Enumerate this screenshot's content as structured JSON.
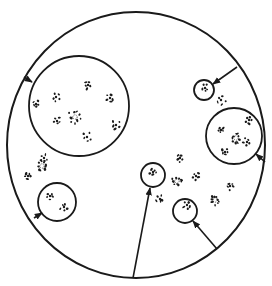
{
  "diagram": {
    "ink": "#1a1a1a",
    "background": "#ffffff",
    "outer_boundary": {
      "cx": 136,
      "cy": 145,
      "rx": 129,
      "ry": 133,
      "stroke": 2
    },
    "circles": [
      {
        "id": "large-top-left",
        "cx": 79,
        "cy": 106,
        "r": 50
      },
      {
        "id": "small-top-right",
        "cx": 204,
        "cy": 90,
        "r": 10
      },
      {
        "id": "right",
        "cx": 234,
        "cy": 136,
        "r": 28
      },
      {
        "id": "bottom-left",
        "cx": 57,
        "cy": 202,
        "r": 19
      },
      {
        "id": "bottom-center-left",
        "cx": 153,
        "cy": 175,
        "r": 12
      },
      {
        "id": "bottom-center-right",
        "cx": 185,
        "cy": 211,
        "r": 12
      }
    ],
    "arrows": [
      {
        "target": "large-top-left",
        "x1": 24,
        "y1": 77,
        "x2": 32,
        "y2": 82
      },
      {
        "target": "small-top-right",
        "x1": 237,
        "y1": 67,
        "x2": 213,
        "y2": 84
      },
      {
        "target": "right",
        "x1": 265,
        "y1": 162,
        "x2": 256,
        "y2": 154
      },
      {
        "target": "bottom-left",
        "x1": 34,
        "y1": 218,
        "x2": 42,
        "y2": 213
      },
      {
        "target": "bottom-center-left",
        "x1": 133,
        "y1": 278,
        "x2": 150,
        "y2": 188
      },
      {
        "target": "bottom-center-right",
        "x1": 217,
        "y1": 249,
        "x2": 193,
        "y2": 221
      }
    ],
    "clusters": [
      {
        "cx": 75,
        "cy": 117,
        "r": 7,
        "ring": true
      },
      {
        "cx": 56,
        "cy": 97,
        "r": 5
      },
      {
        "cx": 88,
        "cy": 85,
        "r": 4
      },
      {
        "cx": 110,
        "cy": 98,
        "r": 4
      },
      {
        "cx": 36,
        "cy": 104,
        "r": 4
      },
      {
        "cx": 57,
        "cy": 121,
        "r": 4
      },
      {
        "cx": 116,
        "cy": 125,
        "r": 5
      },
      {
        "cx": 87,
        "cy": 137,
        "r": 5
      },
      {
        "cx": 44,
        "cy": 158,
        "r": 4
      },
      {
        "cx": 42,
        "cy": 166,
        "r": 5,
        "ring": true
      },
      {
        "cx": 28,
        "cy": 176,
        "r": 4
      },
      {
        "cx": 50,
        "cy": 196,
        "r": 4
      },
      {
        "cx": 64,
        "cy": 207,
        "r": 4
      },
      {
        "cx": 205,
        "cy": 88,
        "r": 4
      },
      {
        "cx": 221,
        "cy": 100,
        "r": 5
      },
      {
        "cx": 236,
        "cy": 138,
        "r": 5,
        "ring": true
      },
      {
        "cx": 221,
        "cy": 130,
        "r": 4
      },
      {
        "cx": 249,
        "cy": 120,
        "r": 4
      },
      {
        "cx": 247,
        "cy": 142,
        "r": 4
      },
      {
        "cx": 225,
        "cy": 152,
        "r": 4
      },
      {
        "cx": 153,
        "cy": 172,
        "r": 4
      },
      {
        "cx": 180,
        "cy": 158,
        "r": 4
      },
      {
        "cx": 177,
        "cy": 181,
        "r": 5,
        "ring": true
      },
      {
        "cx": 196,
        "cy": 176,
        "r": 4
      },
      {
        "cx": 187,
        "cy": 205,
        "r": 4
      },
      {
        "cx": 160,
        "cy": 199,
        "r": 4
      },
      {
        "cx": 215,
        "cy": 200,
        "r": 5,
        "ring": true
      },
      {
        "cx": 230,
        "cy": 186,
        "r": 4
      }
    ]
  }
}
